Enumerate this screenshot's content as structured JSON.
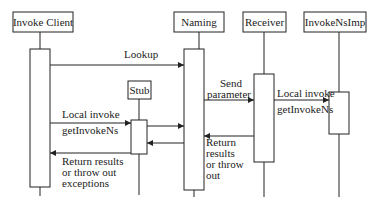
{
  "diagram": {
    "type": "sequence",
    "participants": [
      {
        "id": "client",
        "label": "Invoke Client"
      },
      {
        "id": "naming",
        "label": "Naming"
      },
      {
        "id": "receiver",
        "label": "Receiver"
      },
      {
        "id": "impl",
        "label": "InvokeNsImp"
      },
      {
        "id": "stub",
        "label": "Stub"
      }
    ],
    "messages": {
      "lookup": "Lookup",
      "send_1": "Send",
      "send_2": "parameter",
      "local_invoke_client": "Local invoke",
      "get_invoke_ns_client": "getInvokeNs",
      "local_invoke_receiver": "Local invoke",
      "get_invoke_ns_receiver": "getInvokeNs",
      "return_client_1": "Return results",
      "return_client_2": "or throw out",
      "return_client_3": "exceptions",
      "return_receiver_1": "Return",
      "return_receiver_2": "results",
      "return_receiver_3": "or throw",
      "return_receiver_4": "out"
    }
  }
}
